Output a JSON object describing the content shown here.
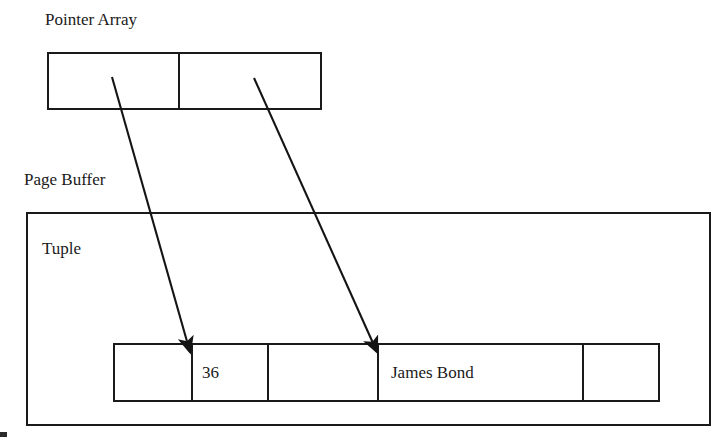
{
  "diagram": {
    "type": "pointer-array-to-tuple-slot-diagram",
    "title_labels": {
      "pointer_array": "Pointer Array",
      "page_buffer": "Page Buffer",
      "tuple": "Tuple"
    },
    "colors": {
      "stroke": "#1a1a1a",
      "background": "#ffffff",
      "text": "#1a1a1a"
    },
    "pointer_array": {
      "label": "Pointer Array",
      "cells": [
        {
          "index": 0,
          "value": ""
        },
        {
          "index": 1,
          "value": ""
        }
      ]
    },
    "page_buffer": {
      "label": "Page Buffer"
    },
    "tuple": {
      "label": "Tuple",
      "cells": [
        {
          "index": 0,
          "value": ""
        },
        {
          "index": 1,
          "value": "36"
        },
        {
          "index": 2,
          "value": ""
        },
        {
          "index": 3,
          "value": "James Bond"
        },
        {
          "index": 4,
          "value": ""
        }
      ]
    },
    "arrows": [
      {
        "name": "pointer-0-to-tuple-slot-1",
        "from": {
          "x": 112,
          "y": 77
        },
        "to": {
          "x": 190,
          "y": 352
        }
      },
      {
        "name": "pointer-1-to-tuple-slot-3",
        "from": {
          "x": 254,
          "y": 78
        },
        "to": {
          "x": 377,
          "y": 352
        }
      }
    ]
  }
}
